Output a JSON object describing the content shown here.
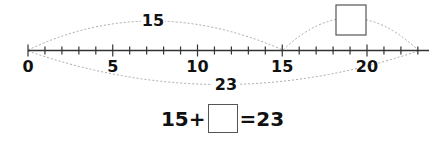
{
  "number_line": {
    "min": 0,
    "max": 23,
    "tick_step": 1,
    "labels": [
      {
        "value": 0,
        "text": "0"
      },
      {
        "value": 5,
        "text": "5"
      },
      {
        "value": 10,
        "text": "10"
      },
      {
        "value": 15,
        "text": "15"
      },
      {
        "value": 20,
        "text": "20"
      }
    ]
  },
  "arcs": {
    "top_left": {
      "from": 0,
      "to": 15,
      "label": "15"
    },
    "top_right": {
      "from": 15,
      "to": 23,
      "label": ""
    },
    "bottom": {
      "from": 0,
      "to": 23,
      "label": "23"
    }
  },
  "equation": {
    "left": "15+",
    "blank": "",
    "right": "=23"
  },
  "colors": {
    "line": "#333333",
    "arc": "#aaaaaa",
    "text": "#111111",
    "box_border": "#555555"
  }
}
